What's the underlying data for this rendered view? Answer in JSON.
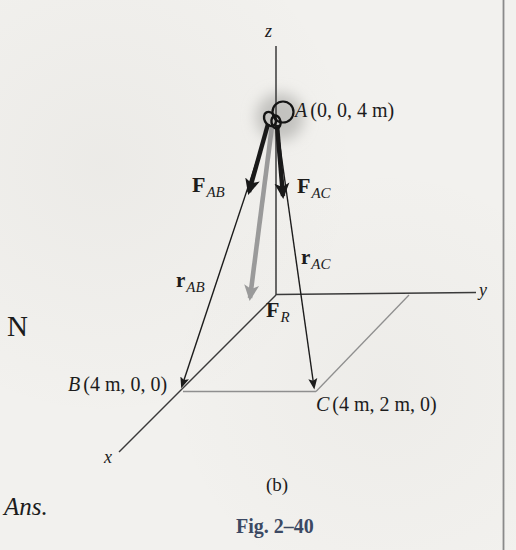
{
  "figure": {
    "caption_sub": "(b)",
    "caption_fig": "Fig. 2–40",
    "margin_unit": "N",
    "margin_ans": "Ans."
  },
  "axes": {
    "x": "x",
    "y": "y",
    "z": "z"
  },
  "points": {
    "A": {
      "letter": "A",
      "coords": "(0, 0, 4 m)"
    },
    "B": {
      "letter": "B",
      "coords": "(4 m, 0, 0)"
    },
    "C": {
      "letter": "C",
      "coords": "(4 m, 2 m, 0)"
    }
  },
  "vectors": {
    "FAB": {
      "symbol": "F",
      "sub": "AB"
    },
    "FAC": {
      "symbol": "F",
      "sub": "AC"
    },
    "FR": {
      "symbol": "F",
      "sub": "R"
    },
    "rAB": {
      "symbol": "r",
      "sub": "AB"
    },
    "rAC": {
      "symbol": "r",
      "sub": "AC"
    }
  },
  "colors": {
    "paper": "#f2f1ee",
    "ink": "#1c1c1c",
    "axis": "#3a3a3a",
    "plane_line": "#8f8f8f",
    "resultant_gray": "#9a9a9a",
    "glow": "#c3c2bf",
    "caption_blue": "#3c4963",
    "column_rule": "#8a8a8a"
  }
}
